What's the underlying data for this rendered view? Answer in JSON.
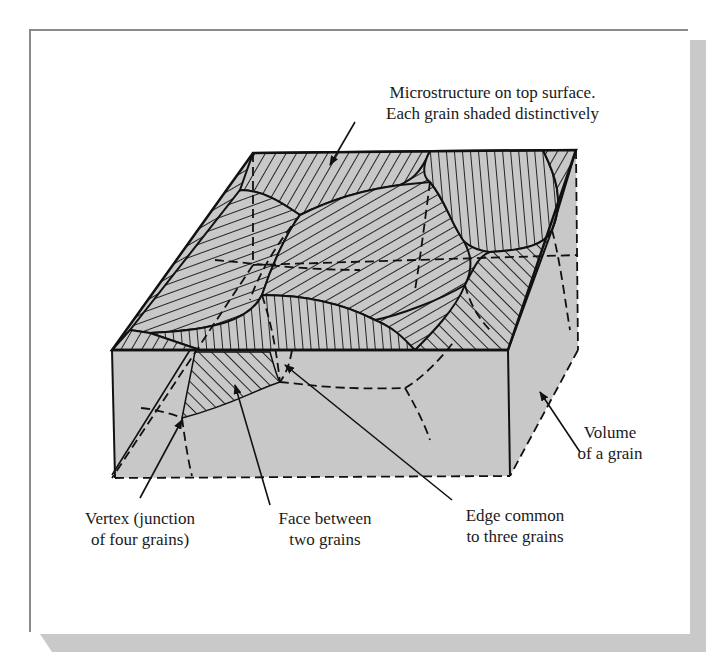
{
  "figure": {
    "colors": {
      "grain_fill": "#c8c8c8",
      "line": "#111111",
      "frame_shadow": "#c9c9c9",
      "frame_border": "#8a8a8a"
    }
  },
  "labels": {
    "top_surface": {
      "line1": "Microstructure on top surface.",
      "line2": "Each grain shaded distinctively"
    },
    "volume": {
      "line1": "Volume",
      "line2": "of a grain"
    },
    "vertex": {
      "line1": "Vertex (junction",
      "line2": "of four grains)"
    },
    "face": {
      "line1": "Face between",
      "line2": "two grains"
    },
    "edge": {
      "line1": "Edge common",
      "line2": "to three grains"
    }
  }
}
